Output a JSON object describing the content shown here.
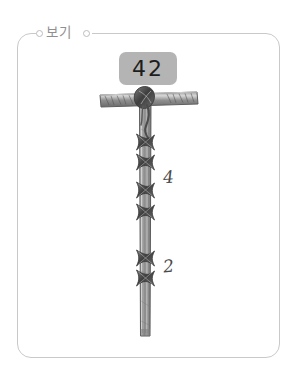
{
  "panel": {
    "caption": "보기",
    "border_color": "#c9c9c9",
    "background_color": "#ffffff"
  },
  "badge": {
    "value": "42",
    "background_color": "#b4b4b4",
    "text_color": "#1d1d1d"
  },
  "figure": {
    "pole_color": "#6d6d6d",
    "knot_color": "#4f4f4f",
    "crossbar": {
      "label": "horizontal-crossbar"
    },
    "knot_groups": [
      {
        "name": "upper-knot-group",
        "count": 4,
        "label": "4"
      },
      {
        "name": "lower-knot-group",
        "count": 2,
        "label": "2"
      }
    ]
  },
  "annotations": [
    {
      "name": "upper-count",
      "text": "4"
    },
    {
      "name": "lower-count",
      "text": "2"
    }
  ]
}
